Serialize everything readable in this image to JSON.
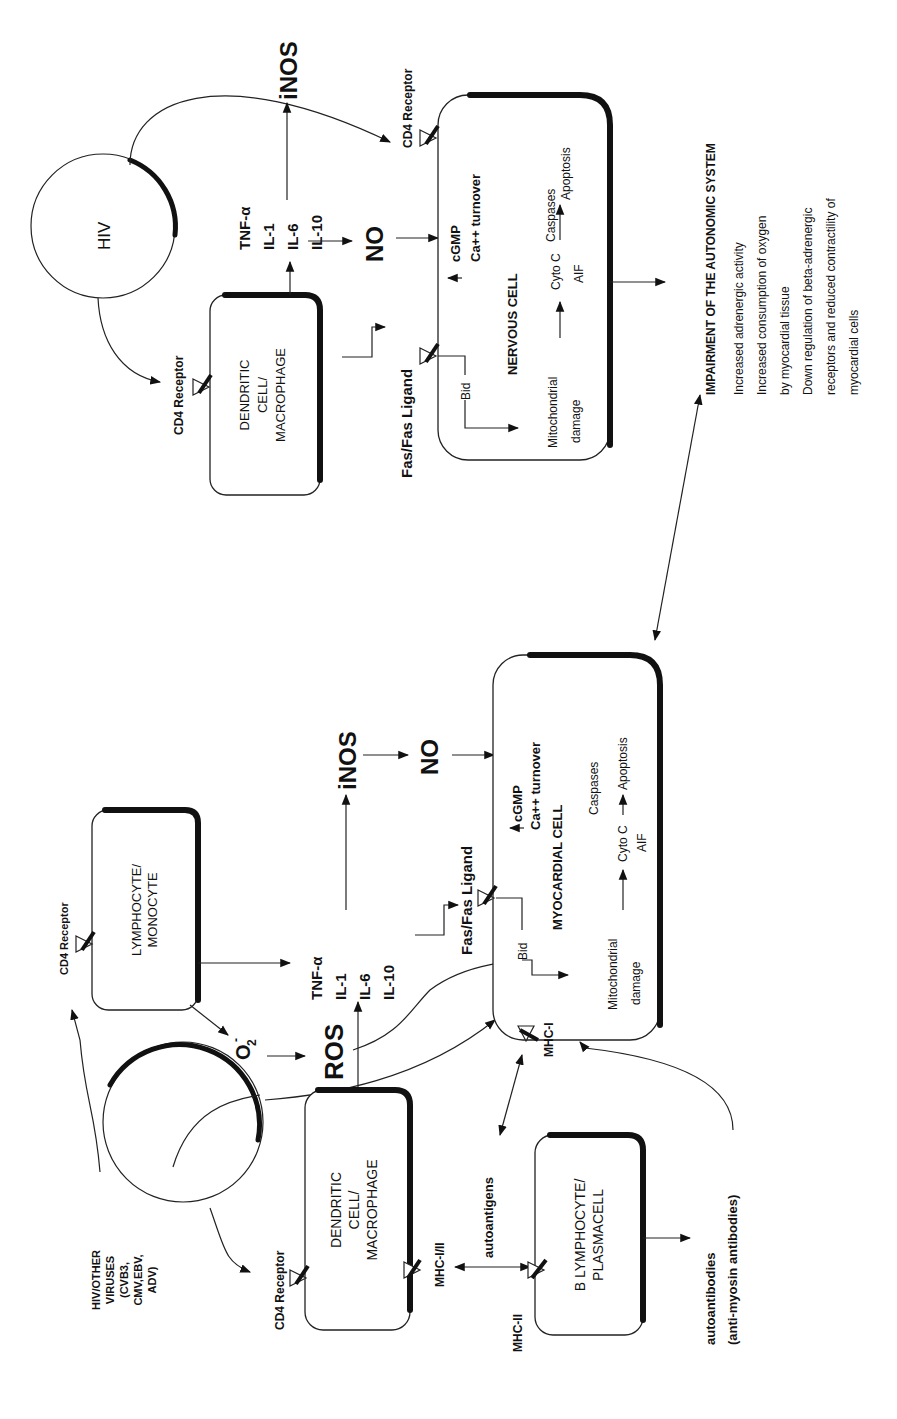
{
  "diagram": {
    "orientation": "rotated-90-ccw",
    "entities": {
      "viruses": {
        "line1": "HIV/OTHER",
        "line2": "VIRUSES",
        "line3": "(CVB3,",
        "line4": "CMV,EBV,",
        "line5": "ADV)"
      },
      "hiv": {
        "label": "HIV"
      },
      "lymphocyte": {
        "line1": "LYMPHOCYTE/",
        "line2": "MONOCYTE"
      },
      "dendritic_bottom": {
        "line1": "DENDRITIC",
        "line2": "CELL/",
        "line3": "MACROPHAGE"
      },
      "dendritic_top": {
        "line1": "DENDRITIC",
        "line2": "CELL/",
        "line3": "MACROPHAGE"
      },
      "b_lymphocyte": {
        "line1": "B LYMPHOCYTE/",
        "line2": "PLASMACELL"
      },
      "myocardial_cell": {
        "title": "MYOCARDIAL CELL",
        "cgmp": "cGMP",
        "ca": "Ca++ turnover",
        "caspases": "Caspases",
        "apoptosis": "Apoptosis",
        "cyto": "Cyto C",
        "aif": "AIF",
        "mito1": "Mitochondrial",
        "mito2": "damage",
        "bid": "Bid"
      },
      "nervous_cell": {
        "title": "NERVOUS CELL",
        "cgmp": "cGMP",
        "ca": "Ca++ turnover",
        "caspases": "Caspases",
        "apoptosis": "Apoptosis",
        "cyto": "Cyto C",
        "aif": "AIF",
        "mito1": "Mitochondrial",
        "mito2": "damage",
        "bid": "Bid"
      }
    },
    "labels": {
      "cd4_receptor": "CD4 Receptor",
      "o2": "O",
      "o2_sub": "2",
      "o2_sup": "-",
      "ros": "ROS",
      "tnf": "TNF-α",
      "il1": "IL-1",
      "il6": "IL-6",
      "il10": "IL-10",
      "inos": "iNOS",
      "no": "NO",
      "fas": "Fas/Fas Ligand",
      "mhc_1_2": "MHC-I/II",
      "mhc_2": "MHC-II",
      "mhc_1": "MHC-I",
      "autoantigens": "autoantigens",
      "autoantibodies1": "autoantibodies",
      "autoantibodies2": "(anti-myosin antibodies)"
    },
    "impairment": {
      "title": "IMPAIRMENT OF THE AUTONOMIC SYSTEM",
      "lines": [
        "Increased adrenergic activity",
        "Increased consumption of oxygen",
        "by myocardial tissue",
        "Down regulation of beta-adrenergic",
        "receptors and reduced contractility of",
        "myocardial cells"
      ]
    }
  }
}
